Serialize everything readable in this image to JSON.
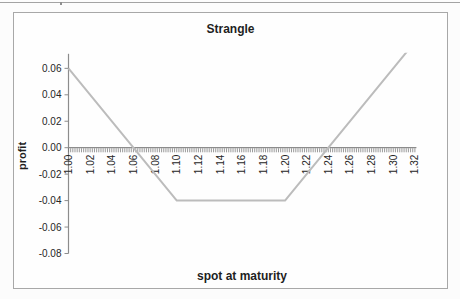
{
  "chart_data": {
    "type": "line",
    "title": "Strangle",
    "xlabel": "spot at maturity",
    "ylabel": "profit",
    "x_tick_labels": [
      "1.00",
      "1.02",
      "1.04",
      "1.06",
      "1.08",
      "1.10",
      "1.12",
      "1.14",
      "1.16",
      "1.18",
      "1.20",
      "1.22",
      "1.24",
      "1.26",
      "1.28",
      "1.30",
      "1.32"
    ],
    "y_tick_labels": [
      "0.06",
      "0.04",
      "0.02",
      "0.00",
      "-0.02",
      "-0.04",
      "-0.06",
      "-0.08"
    ],
    "series": [
      {
        "name": "strangle profit",
        "points": [
          [
            1.0,
            0.06
          ],
          [
            1.1,
            -0.04
          ],
          [
            1.2,
            -0.04
          ],
          [
            1.32,
            0.08
          ]
        ]
      }
    ],
    "xlim": [
      1.0,
      1.32
    ],
    "ylim": [
      -0.08,
      0.071
    ],
    "x_label_step": 0.02,
    "x_minor_step": 0.002,
    "y_major_unit": 0.02,
    "grid": false,
    "legend": false
  },
  "colors": {
    "series_line": "#bcbcbc",
    "axis_line": "#8c8c8c",
    "tick_mark": "#6e6e6e",
    "label_text": "#2a2a2a",
    "frame_border": "#a8a8a8",
    "top_rule": "#a3a3a3"
  },
  "layout_text": {
    "note": ""
  }
}
